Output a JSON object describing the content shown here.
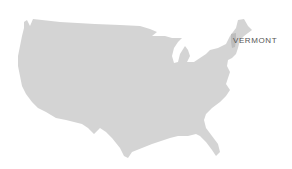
{
  "map": {
    "region": "Contiguous United States",
    "fill_color": "#d4d4d4",
    "highlight_color": "#bdbdbd",
    "background": "#ffffff"
  },
  "highlighted_state": {
    "label": "VERMONT",
    "label_color": "#555555"
  }
}
